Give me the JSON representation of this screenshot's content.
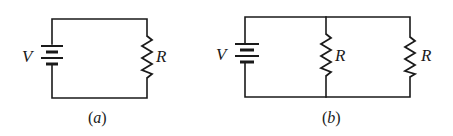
{
  "figure": {
    "panels": [
      {
        "id": "a",
        "caption_open": "(",
        "caption_letter": "a",
        "caption_close": ")",
        "source_label": "V",
        "resistor_labels": [
          "R"
        ],
        "description": "Single resistor R connected across battery V"
      },
      {
        "id": "b",
        "caption_open": "(",
        "caption_letter": "b",
        "caption_close": ")",
        "source_label": "V",
        "resistor_labels": [
          "R",
          "R"
        ],
        "description": "Two resistors R in parallel across battery V"
      }
    ],
    "colors": {
      "line": "#1a1a1a",
      "background": "#ffffff"
    }
  }
}
